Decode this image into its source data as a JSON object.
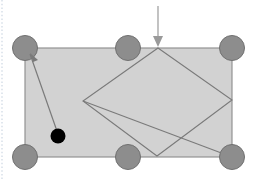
{
  "figure": {
    "canvas": {
      "width": 256,
      "height": 181,
      "background": "#ffffff"
    },
    "colors": {
      "table_fill": "#d2d2d2",
      "table_stroke": "#8a8a8a",
      "pocket_fill": "#8d8d8d",
      "pocket_stroke": "#707070",
      "ball_fill": "#000000",
      "path_stroke": "#7a7a7a",
      "arrow_stroke": "#9a9a9a",
      "margin_guide": "#c8d2e0"
    },
    "table": {
      "label": "billiard-table",
      "x": 25,
      "y": 48,
      "width": 207,
      "height": 109
    },
    "pockets": [
      {
        "label": "pocket-top-left",
        "cx": 25,
        "cy": 48,
        "r": 12.5
      },
      {
        "label": "pocket-top-middle",
        "cx": 128,
        "cy": 48,
        "r": 12.5
      },
      {
        "label": "pocket-top-right",
        "cx": 232,
        "cy": 48,
        "r": 12.5
      },
      {
        "label": "pocket-bottom-left",
        "cx": 25,
        "cy": 157,
        "r": 12.5
      },
      {
        "label": "pocket-bottom-middle",
        "cx": 128,
        "cy": 157,
        "r": 12.5
      },
      {
        "label": "pocket-bottom-right",
        "cx": 232,
        "cy": 157,
        "r": 12.5
      }
    ],
    "ball": {
      "label": "cue-ball",
      "cx": 58,
      "cy": 136,
      "r": 7.5
    },
    "rhombus_path": {
      "label": "bank-shot-rhombus",
      "points": "158,48 232,100 157,156 83,101"
    },
    "diagonal_path": {
      "label": "diagonal-trajectory",
      "x1": 83,
      "y1": 101,
      "x2": 232,
      "y2": 157
    },
    "aim_line": {
      "label": "aim-line-from-ball",
      "x1": 58,
      "y1": 134,
      "x2": 30,
      "y2": 54
    },
    "aim_arrowhead": {
      "points": "30,53 38,60 33,62"
    },
    "pointer_arrow": {
      "label": "target-pointer-arrow",
      "x1": 158,
      "y1": 6,
      "x2": 158,
      "y2": 45,
      "head": "158,47 153,36 163,36"
    },
    "margin_guide": {
      "x": 2,
      "y1": 0,
      "y2": 181
    }
  }
}
